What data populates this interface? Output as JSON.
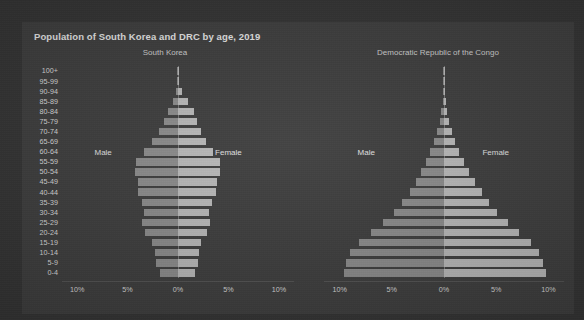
{
  "card": {
    "title": "Population of South Korea and DRC by age, 2019"
  },
  "colors": {
    "background": "#313131",
    "card": "#3b3b3b",
    "male_bar": "#8b8b8b",
    "female_bar": "#b9b9b9",
    "text": "#e8e8e8",
    "axis_text": "#d8d8d8"
  },
  "labels": {
    "male": "Male",
    "female": "Female"
  },
  "axis": {
    "ticks": [
      "10%",
      "5%",
      "0%",
      "5%",
      "10%"
    ],
    "tick_values": [
      -10,
      -5,
      0,
      5,
      10
    ],
    "max_percent": 11.5
  },
  "chart_data": {
    "type": "bar",
    "subtype": "population-pyramid",
    "title": "Population of South Korea and DRC by age, 2019",
    "xlabel": "",
    "ylabel": "",
    "xlim": [
      -11.5,
      11.5
    ],
    "grid": false,
    "legend": [
      "Male",
      "Female"
    ],
    "legend_position": "inside-panels",
    "categories": [
      "100+",
      "95-99",
      "90-94",
      "85-89",
      "80-84",
      "75-79",
      "70-74",
      "65-69",
      "60-64",
      "55-59",
      "50-54",
      "45-49",
      "40-44",
      "35-39",
      "30-34",
      "25-29",
      "20-24",
      "15-19",
      "10-14",
      "5-9",
      "0-4"
    ],
    "panels": [
      {
        "name": "South Korea",
        "title": "South Korea",
        "units": "percent of total population",
        "series": [
          {
            "name": "Male",
            "side": "left",
            "values": [
              0.01,
              0.05,
              0.18,
              0.5,
              1.0,
              1.4,
              1.9,
              2.6,
              3.4,
              4.2,
              4.3,
              4.0,
              4.0,
              3.6,
              3.4,
              3.6,
              3.3,
              2.6,
              2.3,
              2.2,
              1.8
            ]
          },
          {
            "name": "Female",
            "side": "right",
            "values": [
              0.03,
              0.14,
              0.42,
              0.95,
              1.6,
              1.9,
              2.3,
              2.8,
              3.5,
              4.2,
              4.2,
              3.9,
              3.8,
              3.4,
              3.1,
              3.2,
              2.9,
              2.3,
              2.1,
              2.0,
              1.7
            ]
          }
        ]
      },
      {
        "name": "Democratic Republic of the Congo",
        "title": "Democratic Republic of the Congo",
        "units": "percent of total population",
        "series": [
          {
            "name": "Male",
            "side": "left",
            "values": [
              0.01,
              0.02,
              0.05,
              0.12,
              0.25,
              0.42,
              0.65,
              0.95,
              1.3,
              1.7,
              2.2,
              2.7,
              3.3,
              4.0,
              4.8,
              5.8,
              7.0,
              8.1,
              9.0,
              9.4,
              9.6
            ]
          },
          {
            "name": "Female",
            "side": "right",
            "values": [
              0.01,
              0.03,
              0.07,
              0.16,
              0.3,
              0.5,
              0.75,
              1.05,
              1.45,
              1.9,
              2.4,
              3.0,
              3.6,
              4.3,
              5.1,
              6.1,
              7.2,
              8.3,
              9.1,
              9.5,
              9.8
            ]
          }
        ]
      }
    ]
  }
}
